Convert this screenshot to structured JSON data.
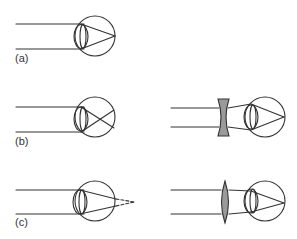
{
  "diagram": {
    "type": "eye-refraction-diagram",
    "colors": {
      "stroke": "#333333",
      "lens_fill": "#9a9a9a",
      "background": "#ffffff"
    },
    "panels": [
      {
        "id": "a",
        "label": "(a)",
        "description": "Normal eye: parallel rays focus on the retina",
        "eye": {
          "cx": 95,
          "cy": 36,
          "r": 20
        },
        "rays_y": [
          24,
          49
        ],
        "focus": "retina"
      },
      {
        "id": "b",
        "label": "(b)",
        "description": "Myopic eye: rays focus in front of the retina",
        "eye": {
          "cx": 95,
          "cy": 117,
          "r": 20
        },
        "rays_y": [
          107,
          132
        ],
        "focus": "before-retina"
      },
      {
        "id": "b-corrected",
        "label": "",
        "description": "Myopia corrected with a concave (diverging) lens",
        "eye": {
          "cx": 265,
          "cy": 117,
          "r": 20
        },
        "rays_y": [
          108,
          127
        ],
        "corrective_lens": "concave"
      },
      {
        "id": "c",
        "label": "(c)",
        "description": "Hyperopic eye: rays focus behind the retina",
        "eye": {
          "cx": 95,
          "cy": 201,
          "r": 20
        },
        "rays_y": [
          190,
          214
        ],
        "focus": "behind-retina"
      },
      {
        "id": "c-corrected",
        "label": "",
        "description": "Hyperopia corrected with a convex (converging) lens",
        "eye": {
          "cx": 265,
          "cy": 201,
          "r": 20
        },
        "rays_y": [
          190,
          214
        ],
        "corrective_lens": "convex"
      }
    ]
  }
}
